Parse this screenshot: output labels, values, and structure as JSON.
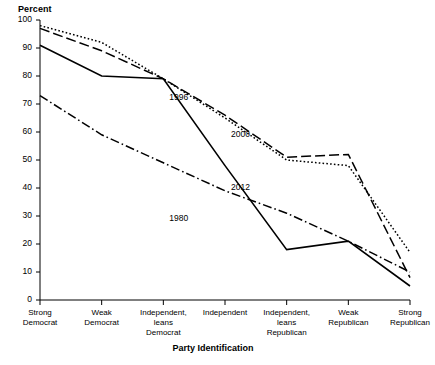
{
  "chart_data": {
    "type": "line",
    "title": "",
    "ylabel": "Percent",
    "xlabel": "Party Identification",
    "ylim": [
      0,
      100
    ],
    "yticks": [
      0,
      10,
      20,
      30,
      40,
      50,
      60,
      70,
      80,
      90,
      100
    ],
    "grid": false,
    "legend_position": "inline-annotations",
    "categories": [
      "Strong Democrat",
      "Weak Democrat",
      "Independent, leans Democrat",
      "Independent",
      "Independent, leans Republican",
      "Weak Republican",
      "Strong Republican"
    ],
    "category_lines": [
      [
        "Strong",
        "Democrat"
      ],
      [
        "Weak",
        "Democrat"
      ],
      [
        "Independent,",
        "leans",
        "Democrat"
      ],
      [
        "Independent"
      ],
      [
        "Independent,",
        "leans",
        "Republican"
      ],
      [
        "Weak",
        "Republican"
      ],
      [
        "Strong",
        "Republican"
      ]
    ],
    "series": [
      {
        "name": "1980",
        "style": "dash-dot",
        "values": [
          73,
          59,
          49,
          39,
          31,
          21,
          10
        ]
      },
      {
        "name": "1996",
        "style": "dotted",
        "values": [
          98,
          92,
          79,
          65,
          50,
          48,
          17
        ]
      },
      {
        "name": "2000",
        "style": "dashed",
        "values": [
          97,
          89,
          79,
          66,
          51,
          52,
          8
        ]
      },
      {
        "name": "2012",
        "style": "solid",
        "values": [
          91,
          80,
          79,
          48,
          18,
          21,
          5
        ]
      }
    ],
    "annotations": [
      {
        "text": "1996",
        "x_category": "Independent, leans Democrat",
        "y": 72
      },
      {
        "text": "2000",
        "x_category": "Independent",
        "y": 59
      },
      {
        "text": "2012",
        "x_category": "Independent",
        "y": 40
      },
      {
        "text": "1980",
        "x_category": "Independent, leans Democrat",
        "y": 29
      }
    ]
  }
}
